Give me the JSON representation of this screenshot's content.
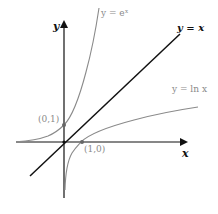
{
  "figure": {
    "axes": {
      "x_label": "x",
      "y_label": "y"
    },
    "curves": [
      {
        "id": "exp",
        "label": "y = eˣ",
        "color": "#8a8a8a"
      },
      {
        "id": "identity",
        "label": "y = x",
        "color": "#111111"
      },
      {
        "id": "ln",
        "label": "y = ln x",
        "color": "#8a8a8a"
      }
    ],
    "points": [
      {
        "label": "(0,1)",
        "x": 0,
        "y": 1
      },
      {
        "label": "(1,0)",
        "x": 1,
        "y": 0
      }
    ],
    "colors": {
      "axis": "#111111",
      "curve_gray": "#8a8a8a",
      "line_black": "#111111"
    }
  }
}
